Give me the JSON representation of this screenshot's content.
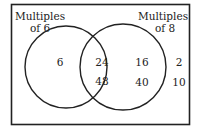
{
  "diagram": {
    "type": "venn",
    "sets": [
      {
        "label_line1": "Multiples",
        "label_line2": "of 6"
      },
      {
        "label_line1": "Multiples",
        "label_line2": "of 8"
      }
    ],
    "regions": {
      "only_6": [
        "6"
      ],
      "both": [
        "24",
        "48"
      ],
      "only_8": [
        "16",
        "40"
      ],
      "neither": [
        "2",
        "10"
      ]
    },
    "colors": {
      "stroke": "#222222",
      "background": "#ffffff"
    }
  }
}
